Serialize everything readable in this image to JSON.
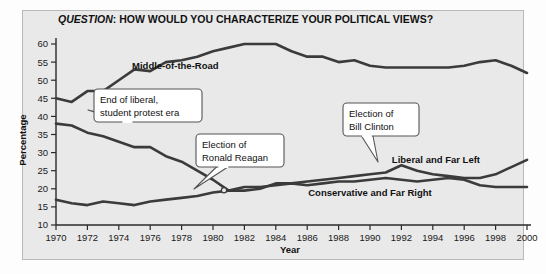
{
  "chart_data": {
    "type": "line",
    "title": "QUESTION: HOW WOULD YOU CHARACTERIZE YOUR POLITICAL VIEWS?",
    "title_italic_part": "QUESTION",
    "title_rest": ": HOW WOULD YOU CHARACTERIZE YOUR POLITICAL VIEWS?",
    "xlabel": "Year",
    "ylabel": "Percentage",
    "xlim": [
      1970,
      2000
    ],
    "ylim": [
      10,
      60
    ],
    "ytick_step": 5,
    "xtick_step": 2,
    "grid": false,
    "legend_position": "inline-labels",
    "x": [
      1970,
      1971,
      1972,
      1973,
      1974,
      1975,
      1976,
      1977,
      1978,
      1979,
      1980,
      1981,
      1982,
      1983,
      1984,
      1985,
      1986,
      1987,
      1988,
      1989,
      1990,
      1991,
      1992,
      1993,
      1994,
      1995,
      1996,
      1997,
      1998,
      1999,
      2000
    ],
    "xticks": [
      "1970",
      "1972",
      "1974",
      "1976",
      "1978",
      "1980",
      "1982",
      "1984",
      "1986",
      "1988",
      "1990",
      "1992",
      "1994",
      "1996",
      "1998",
      "2000"
    ],
    "yticks": [
      "10",
      "15",
      "20",
      "25",
      "30",
      "35",
      "40",
      "45",
      "50",
      "55",
      "60"
    ],
    "series": [
      {
        "name": "Middle-of-the-Road",
        "color": "#3b3b3b",
        "label_x": 1977.6,
        "label_y": 53.0,
        "values": [
          45,
          44,
          47,
          47,
          50,
          53,
          52.5,
          55,
          55.5,
          56.5,
          58,
          59,
          60,
          60,
          60,
          58,
          56.5,
          56.5,
          55,
          55.5,
          54,
          53.5,
          53.5,
          53.5,
          53.5,
          53.5,
          54,
          55,
          55.5,
          54,
          52
        ]
      },
      {
        "name": "Liberal and Far Left",
        "color": "#3b3b3b",
        "label_x": 1994.2,
        "label_y": 27.0,
        "values": [
          38,
          37.5,
          35.5,
          34.5,
          33,
          31.5,
          31.5,
          29,
          27.5,
          25,
          22.5,
          19.5,
          19.5,
          20,
          21.5,
          21.5,
          22,
          22.5,
          23,
          23.5,
          24,
          24.5,
          26.5,
          25,
          24,
          23.5,
          23,
          23,
          24,
          26,
          28
        ]
      },
      {
        "name": "Conservative and Far Right",
        "color": "#3b3b3b",
        "label_x": 1990.0,
        "label_y": 18.0,
        "values": [
          17,
          16,
          15.5,
          16.5,
          16,
          15.5,
          16.5,
          17,
          17.5,
          18,
          19,
          19.5,
          20.5,
          20.5,
          21,
          21.5,
          21,
          21.5,
          22,
          22,
          22.5,
          23,
          22.5,
          22,
          22.5,
          23,
          22.5,
          21,
          20.5,
          20.5,
          20.5
        ]
      }
    ],
    "annotations": [
      {
        "id": "liberal-era",
        "lines": [
          "End of liberal,",
          "student protest era"
        ],
        "box_x": 94,
        "box_y": 89,
        "box_w": 108,
        "box_h": 33,
        "point_x": 88,
        "point_y": 110
      },
      {
        "id": "reagan",
        "lines": [
          "Election of",
          "Ronald Reagan"
        ],
        "box_x": 196,
        "box_y": 134,
        "box_w": 88,
        "box_h": 33,
        "point_x": 194,
        "point_y": 189
      },
      {
        "id": "clinton",
        "lines": [
          "Election of",
          "Bill Clinton"
        ],
        "box_x": 343,
        "box_y": 103,
        "box_w": 76,
        "box_h": 33,
        "point_x": 378,
        "point_y": 162
      }
    ],
    "colors": {
      "panel_background": "#e9e9e9",
      "outer_background": "#fdfdfd",
      "line": "#3b3b3b",
      "axis": "#2a2a2a",
      "panel_border": "#b9b9b9",
      "callout_fill": "#ffffff",
      "callout_border": "#555555"
    }
  }
}
